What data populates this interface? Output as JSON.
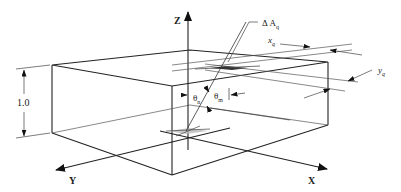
{
  "diagram": {
    "axes": {
      "x_label": "X",
      "y_label": "Y",
      "z_label": "Z"
    },
    "dimension": {
      "height_label": "1.0"
    },
    "annotations": {
      "delta_area": "Δ A",
      "delta_area_sub": "q",
      "x_q": "x",
      "x_q_sub": "q",
      "y_q": "y",
      "y_q_sub": "q",
      "theta_n": "θ",
      "theta_n_sub": "n",
      "theta_m": "θ",
      "theta_m_sub": "m"
    },
    "colors": {
      "line": "#222222",
      "thin_line": "#555555",
      "patch_fill": "#bbbbbb"
    }
  }
}
